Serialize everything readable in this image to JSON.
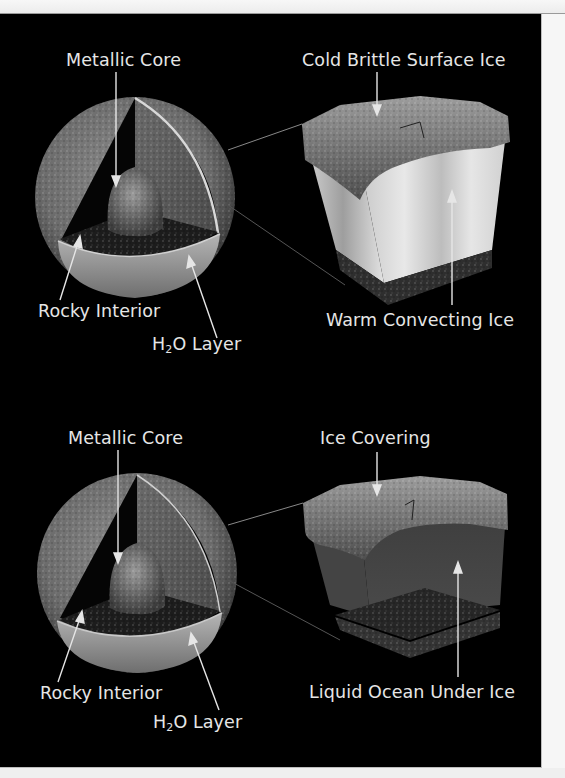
{
  "figure": {
    "background": "#000000",
    "label_color": "#e6e6e6",
    "models": [
      {
        "name": "convecting-ice-shell",
        "sphere_labels": {
          "core": "Metallic Core",
          "interior": "Rocky Interior",
          "h2o_prefix": "H",
          "h2o_sub": "2",
          "h2o_suffix": "O Layer"
        },
        "block_labels": {
          "top": "Cold Brittle Surface Ice",
          "bottom": "Warm Convecting Ice"
        }
      },
      {
        "name": "subsurface-ocean",
        "sphere_labels": {
          "core": "Metallic Core",
          "interior": "Rocky Interior",
          "h2o_prefix": "H",
          "h2o_sub": "2",
          "h2o_suffix": "O Layer"
        },
        "block_labels": {
          "top": "Ice Covering",
          "bottom": "Liquid Ocean Under Ice"
        }
      }
    ]
  }
}
